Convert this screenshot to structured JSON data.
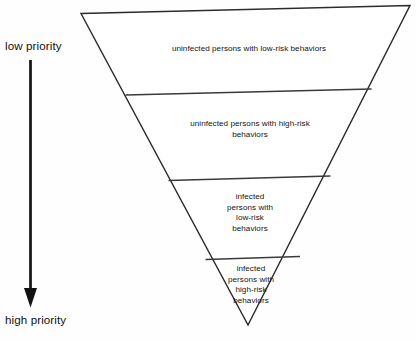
{
  "diagram": {
    "background_color": "#fefefe",
    "line_color": "#2b2b2b",
    "text_color": "#131313",
    "axis": {
      "top_label": "low priority",
      "bottom_label": "high priority",
      "arrow_direction": "down"
    },
    "bands": [
      {
        "text": "uninfected persons with low-risk behaviors"
      },
      {
        "text": "uninfected persons with high-risk\nbehaviors"
      },
      {
        "text": "infected\npersons with\nlow-risk\nbehaviors"
      },
      {
        "text": "infected\npersons with\nhigh-risk\nbehaviors"
      }
    ]
  }
}
